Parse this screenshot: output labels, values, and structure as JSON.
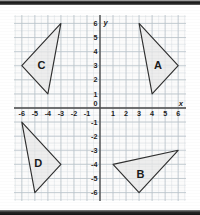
{
  "document": {
    "title": "Coordinate plane with four congruent triangles",
    "background_color": "#ffffff",
    "plot_background_color": "#fbfbfb"
  },
  "scan_artifacts": {
    "top_bar_label": "scan-edge-top",
    "bottom_bar_label": "scan-edge-bottom",
    "bar_color": "#141414"
  },
  "chart_data": {
    "type": "scatter",
    "title": "",
    "xlabel": "x",
    "ylabel": "y",
    "xlim": [
      -6.6,
      6.6
    ],
    "ylim": [
      -6.6,
      6.6
    ],
    "grid": true,
    "grid_major_step": 1,
    "grid_minor_step": 0.5,
    "axis_origin_label": "0",
    "x_tick_labels": [
      "-6",
      "-5",
      "-4",
      "-3",
      "-2",
      "-1",
      "0",
      "1",
      "2",
      "3",
      "4",
      "5",
      "6"
    ],
    "x_tick_values": [
      -6,
      -5,
      -4,
      -3,
      -2,
      -1,
      0,
      1,
      2,
      3,
      4,
      5,
      6
    ],
    "y_tick_labels": [
      "6",
      "5",
      "4",
      "3",
      "2",
      "1",
      "0",
      "-1",
      "-2",
      "-3",
      "-4",
      "-5",
      "-6"
    ],
    "y_tick_values": [
      6,
      5,
      4,
      3,
      2,
      1,
      0,
      -1,
      -2,
      -3,
      -4,
      -5,
      -6
    ],
    "axis_label_x": "x",
    "axis_label_y": "y",
    "series": [
      {
        "name": "A",
        "label": "A",
        "quadrant": "I",
        "label_position": [
          4.45,
          3.0
        ],
        "vertices": [
          [
            3,
            6
          ],
          [
            6,
            3
          ],
          [
            4,
            1
          ]
        ],
        "fill": "#e9e9e9",
        "stroke": "#2f2f2f"
      },
      {
        "name": "B",
        "label": "B",
        "quadrant": "IV",
        "label_position": [
          3.1,
          -4.75
        ],
        "vertices": [
          [
            1,
            -4
          ],
          [
            6,
            -3
          ],
          [
            3,
            -6
          ]
        ],
        "fill": "#e9e9e9",
        "stroke": "#2f2f2f"
      },
      {
        "name": "C",
        "label": "C",
        "quadrant": "II",
        "label_position": [
          -4.5,
          3.0
        ],
        "vertices": [
          [
            -3,
            6
          ],
          [
            -6,
            3
          ],
          [
            -4,
            1
          ]
        ],
        "fill": "#e9e9e9",
        "stroke": "#2f2f2f"
      },
      {
        "name": "D",
        "label": "D",
        "quadrant": "III",
        "label_position": [
          -4.75,
          -4.0
        ],
        "vertices": [
          [
            -6,
            -1
          ],
          [
            -3,
            -4
          ],
          [
            -5,
            -6
          ]
        ],
        "fill": "#e9e9e9",
        "stroke": "#2f2f2f"
      }
    ]
  }
}
